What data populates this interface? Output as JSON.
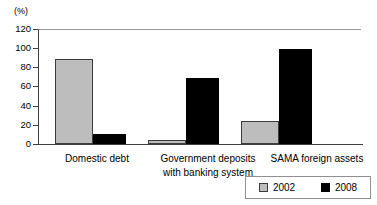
{
  "chart_data": {
    "type": "bar",
    "title": "",
    "subtitle": "",
    "unit_label": "(%)",
    "xlabel": "",
    "ylabel": "",
    "ylim": [
      0,
      120
    ],
    "yticks": [
      0,
      20,
      40,
      60,
      80,
      100,
      120
    ],
    "ytick_labels": [
      "0",
      "20",
      "40",
      "60",
      "80",
      "100",
      "120"
    ],
    "grid": false,
    "legend_position": "bottom-right",
    "categories": [
      "Domestic debt",
      "Government deposits with banking system",
      "SAMA foreign assets"
    ],
    "category_lines": [
      [
        "Domestic debt"
      ],
      [
        "Government deposits",
        "with banking system"
      ],
      [
        "SAMA foreign assets"
      ]
    ],
    "series": [
      {
        "name": "2002",
        "color": "#bdbdbd",
        "values": [
          89,
          4,
          24
        ]
      },
      {
        "name": "2008",
        "color": "#000000",
        "values": [
          10,
          69,
          99
        ]
      }
    ]
  },
  "legend": {
    "entries": [
      {
        "label": "2002",
        "swatch": "gray-square-swatch"
      },
      {
        "label": "2008",
        "swatch": "black-square-swatch"
      }
    ]
  }
}
